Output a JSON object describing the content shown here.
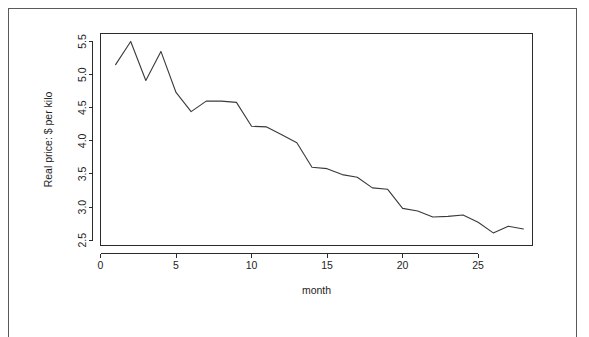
{
  "chart_data": {
    "type": "line",
    "title": "",
    "subtitle": "",
    "xlabel": "month",
    "ylabel": "Real price: $ per kilo",
    "xlim": [
      0,
      28.6
    ],
    "ylim": [
      2.42,
      5.62
    ],
    "xticks": [
      0,
      5,
      10,
      15,
      20,
      25
    ],
    "xtick_labels": [
      "0",
      "5",
      "10",
      "15",
      "20",
      "25"
    ],
    "yticks": [
      2.5,
      3.0,
      3.5,
      4.0,
      4.5,
      5.0,
      5.5
    ],
    "ytick_labels": [
      "2.5",
      "3.0",
      "3.5",
      "4.0",
      "4.5",
      "5.0",
      "5.5"
    ],
    "grid": false,
    "legend": false,
    "legend_position": "none",
    "x": [
      1,
      2,
      3,
      4,
      5,
      6,
      7,
      8,
      9,
      10,
      11,
      12,
      13,
      14,
      15,
      16,
      17,
      18,
      19,
      20,
      21,
      22,
      23,
      24,
      25,
      26,
      27,
      28
    ],
    "values": [
      5.15,
      5.5,
      4.91,
      5.35,
      4.73,
      4.44,
      4.6,
      4.6,
      4.58,
      4.22,
      4.21,
      4.09,
      3.97,
      3.6,
      3.58,
      3.49,
      3.45,
      3.29,
      3.27,
      2.98,
      2.94,
      2.85,
      2.86,
      2.88,
      2.77,
      2.61,
      2.71,
      2.67
    ],
    "series": [
      {
        "name": "Real price",
        "color": "#3a3a3a",
        "values": [
          5.15,
          5.5,
          4.91,
          5.35,
          4.73,
          4.44,
          4.6,
          4.6,
          4.58,
          4.22,
          4.21,
          4.09,
          3.97,
          3.6,
          3.58,
          3.49,
          3.45,
          3.29,
          3.27,
          2.98,
          2.94,
          2.85,
          2.86,
          2.88,
          2.77,
          2.61,
          2.71,
          2.67
        ]
      }
    ]
  },
  "colors": {
    "line": "#3a3a3a",
    "axis": "#2b2b2b",
    "text": "#1e1e1e",
    "page_border": "#5a5a5a",
    "background": "#ffffff"
  }
}
